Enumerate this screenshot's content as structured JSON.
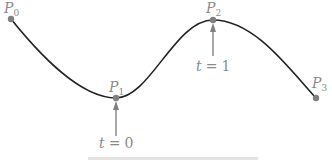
{
  "diagram": {
    "type": "cubic-curve-through-points",
    "curve_color": "#222222",
    "point_color": "#808080",
    "label_color": "#8a8a8a",
    "points": [
      {
        "label": "P",
        "sub": "0",
        "x": 11,
        "y": 19
      },
      {
        "label": "P",
        "sub": "1",
        "x": 116,
        "y": 98
      },
      {
        "label": "P",
        "sub": "2",
        "x": 213,
        "y": 20
      },
      {
        "label": "P",
        "sub": "3",
        "x": 316,
        "y": 98
      }
    ],
    "annotations": [
      {
        "var": "t",
        "op": "=",
        "value": "0",
        "target": "P1"
      },
      {
        "var": "t",
        "op": "=",
        "value": "1",
        "target": "P2"
      }
    ],
    "caption": "(partially clipped caption)"
  }
}
